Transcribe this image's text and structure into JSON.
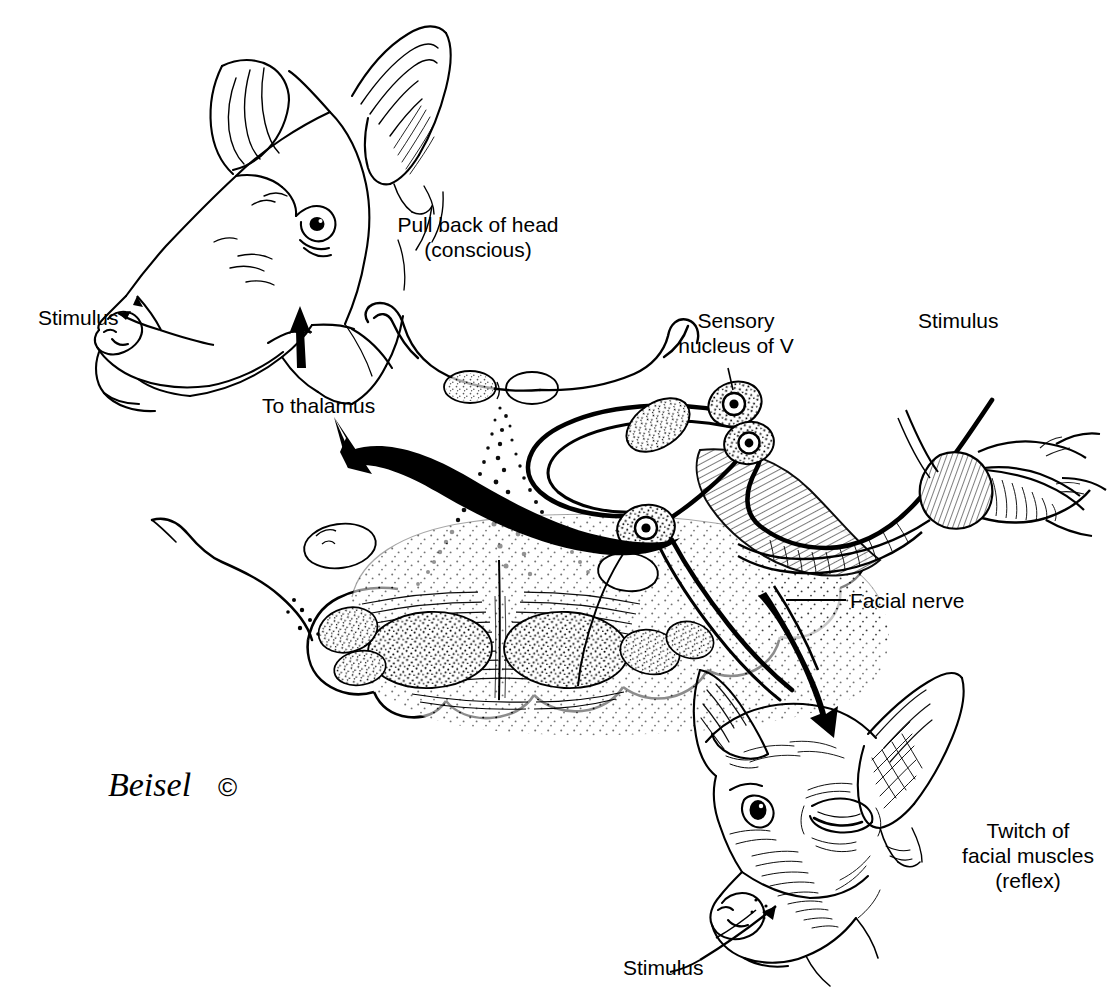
{
  "figure": {
    "ink_color": "#000000",
    "background_color": "#ffffff",
    "width": 1109,
    "height": 1005
  },
  "labels": {
    "stimulus_top_left": "Stimulus",
    "pull_back_of_head_line1": "Pull back of head",
    "pull_back_of_head_line2": "(conscious)",
    "to_thalamus": "To thalamus",
    "sensory_nucleus_line1": "Sensory",
    "sensory_nucleus_line2": "nucleus of V",
    "stimulus_top_right": "Stimulus",
    "facial_nerve": "Facial nerve",
    "twitch_line1": "Twitch of",
    "twitch_line2": "facial muscles",
    "twitch_line3": "(reflex)",
    "stimulus_bottom": "Stimulus"
  },
  "credit": {
    "signature": "Beisel",
    "copyright_symbol": "©"
  },
  "structures": {
    "head_upper_left": "dog-head-profile-pulled-back",
    "head_lower_right": "dog-head-three-quarter-squinting",
    "brainstem": "brainstem-cross-section",
    "pyramids": "pyramidal-tracts",
    "neurons": "neuron-cell-bodies",
    "sensory_nerve": "trigeminal-sensory-nerve",
    "motor_nerve": "facial-motor-nerve",
    "ganglion": "trigeminal-ganglion"
  },
  "arrows": {
    "to_thalamus_curved": "curved-arrow-up-left",
    "to_head_straight": "straight-arrow-up",
    "to_face_curved": "curved-arrow-down-right",
    "stimulus_pointer_top": "thin-arrow-to-muzzle",
    "stimulus_pointer_bottom": "thin-arrow-to-cheek"
  }
}
